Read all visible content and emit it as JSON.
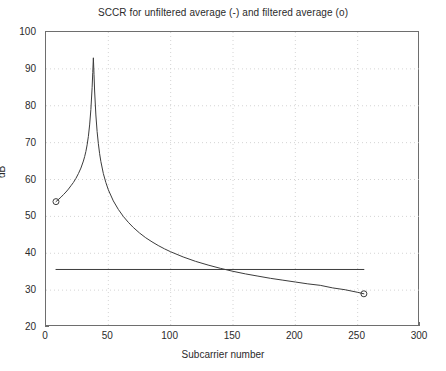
{
  "chart_data": {
    "type": "line",
    "title": "SCCR for unfiltered average (-)  and filtered average (o)",
    "xlabel": "Subcarrier number",
    "ylabel": "dB",
    "xlim": [
      0,
      300
    ],
    "ylim": [
      20,
      100
    ],
    "xticks": [
      0,
      50,
      100,
      150,
      200,
      250,
      300
    ],
    "yticks": [
      20,
      30,
      40,
      50,
      60,
      70,
      80,
      90,
      100
    ],
    "grid": true,
    "grid_style": "dotted",
    "legend": "none",
    "series": [
      {
        "name": "unfiltered average",
        "marker": "o",
        "line": "-",
        "color": "#3c3c3c",
        "endpoint_markers": [
          {
            "x": 8,
            "y": 54.0
          },
          {
            "x": 255,
            "y": 29.0
          }
        ],
        "x": [
          8,
          10,
          12,
          14,
          16,
          18,
          20,
          22,
          24,
          26,
          28,
          30,
          31,
          32,
          33,
          34,
          35,
          36,
          37,
          37.5,
          38,
          38.5,
          39,
          40,
          41,
          42,
          43,
          44,
          46,
          48,
          50,
          54,
          58,
          62,
          66,
          70,
          75,
          80,
          85,
          90,
          95,
          100,
          110,
          120,
          130,
          140,
          150,
          160,
          170,
          180,
          190,
          200,
          210,
          220,
          230,
          240,
          250,
          255
        ],
        "y": [
          54.0,
          54.6,
          55.2,
          55.9,
          56.6,
          57.4,
          58.3,
          59.2,
          60.3,
          61.6,
          63.1,
          65.0,
          66.2,
          67.6,
          69.4,
          71.7,
          74.8,
          79.0,
          85.0,
          89.0,
          93.0,
          88.5,
          84.0,
          77.5,
          73.0,
          69.7,
          67.0,
          64.9,
          61.6,
          59.2,
          57.2,
          54.2,
          51.9,
          50.0,
          48.4,
          47.0,
          45.5,
          44.2,
          43.1,
          42.1,
          41.2,
          40.4,
          39.0,
          37.8,
          36.8,
          35.9,
          35.1,
          34.4,
          33.8,
          33.2,
          32.7,
          32.2,
          31.7,
          31.3,
          30.6,
          30.1,
          29.4,
          29.0
        ]
      },
      {
        "name": "filtered average",
        "marker": "-",
        "line": "-",
        "color": "#3c3c3c",
        "constant_value": 35.6,
        "x": [
          8,
          255
        ],
        "y": [
          35.6,
          35.6
        ]
      }
    ]
  },
  "axes": {
    "y_tick_labels": [
      "100",
      "90",
      "80",
      "70",
      "60",
      "50",
      "40",
      "30",
      "20"
    ],
    "x_tick_labels": [
      "0",
      "50",
      "100",
      "150",
      "200",
      "250",
      "300"
    ]
  }
}
